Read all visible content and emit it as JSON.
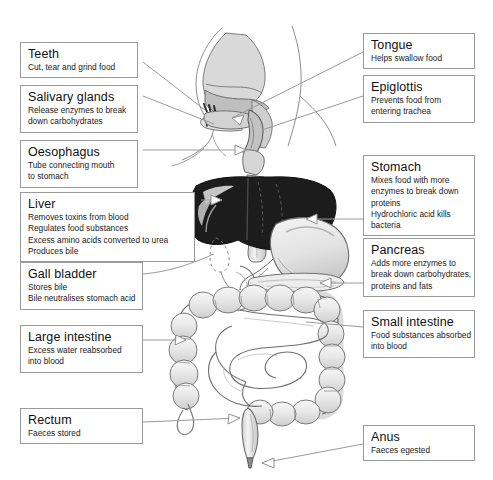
{
  "diagram": {
    "type": "anatomical-diagram",
    "background_color": "#ffffff",
    "label_box_border": "#9a9a9a",
    "leader_line_color": "#9a9a9a",
    "organ_colors": {
      "liver": "#1c1c1c",
      "liver_highlight": "#d8d8d8",
      "stomach": "#e6e6e6",
      "intestine": "#ececec",
      "outline": "#6e6e6e",
      "head": "#dcdcdc"
    }
  },
  "labels": {
    "left": [
      {
        "name": "teeth",
        "title": "Teeth",
        "lines": [
          "Cut, tear and grind food"
        ]
      },
      {
        "name": "salivary-glands",
        "title": "Salivary glands",
        "lines": [
          "Release enzymes to break",
          "down carbohydrates"
        ]
      },
      {
        "name": "oesophagus",
        "title": "Oesophagus",
        "lines": [
          "Tube connecting mouth",
          "to stomach"
        ]
      },
      {
        "name": "liver",
        "title": "Liver",
        "lines": [
          "Removes toxins from blood",
          "Regulates food substances",
          "Excess amino acids converted to urea",
          "Produces bile"
        ]
      },
      {
        "name": "gall-bladder",
        "title": "Gall bladder",
        "lines": [
          "Stores bile",
          "Bile neutralises stomach acid"
        ]
      },
      {
        "name": "large-intestine",
        "title": "Large intestine",
        "lines": [
          "Excess water reabsorbed",
          "into blood"
        ]
      },
      {
        "name": "rectum",
        "title": "Rectum",
        "lines": [
          "Faeces stored"
        ]
      }
    ],
    "right": [
      {
        "name": "tongue",
        "title": "Tongue",
        "lines": [
          "Helps swallow food"
        ]
      },
      {
        "name": "epiglottis",
        "title": "Epiglottis",
        "lines": [
          "Prevents food from",
          "entering trachea"
        ]
      },
      {
        "name": "stomach",
        "title": "Stomach",
        "lines": [
          "Mixes food with more",
          "enzymes to break down",
          "proteins",
          "Hydrochloric acid kills",
          "bacteria"
        ]
      },
      {
        "name": "pancreas",
        "title": "Pancreas",
        "lines": [
          "Adds more enzymes to",
          "break down carbohydrates,",
          "proteins and fats"
        ]
      },
      {
        "name": "small-intestine",
        "title": "Small intestine",
        "lines": [
          "Food substances absorbed",
          "into blood"
        ]
      },
      {
        "name": "anus",
        "title": "Anus",
        "lines": [
          "Faeces egested"
        ]
      }
    ]
  }
}
